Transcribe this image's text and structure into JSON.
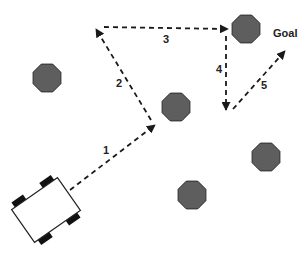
{
  "diagram": {
    "colors": {
      "obstacle_fill": "#5e5e5e",
      "obstacle_stroke": "#2e2e2e",
      "path": "#1a1a1a",
      "robot_body": "#ffffff",
      "robot_wheel": "#111111",
      "text": "#222222"
    },
    "goal_label": "Goal",
    "robot": {
      "cx": 46,
      "cy": 210,
      "width": 56,
      "height": 40,
      "angle": -35
    },
    "obstacles": [
      {
        "name": "obstacle-left",
        "cx": 47,
        "cy": 78,
        "r": 15
      },
      {
        "name": "obstacle-center",
        "cx": 176,
        "cy": 107,
        "r": 15
      },
      {
        "name": "obstacle-top-right",
        "cx": 246,
        "cy": 29,
        "r": 15
      },
      {
        "name": "obstacle-right",
        "cx": 266,
        "cy": 157,
        "r": 15
      },
      {
        "name": "obstacle-bottom",
        "cx": 192,
        "cy": 195,
        "r": 15
      }
    ],
    "path_segments": [
      {
        "label": "1",
        "x1": 70,
        "y1": 190,
        "x2": 155,
        "y2": 125,
        "label_x": 103,
        "label_y": 154
      },
      {
        "label": "2",
        "x1": 151,
        "y1": 120,
        "x2": 96,
        "y2": 29,
        "label_x": 116,
        "label_y": 87
      },
      {
        "label": "3",
        "x1": 104,
        "y1": 27,
        "x2": 228,
        "y2": 29,
        "label_x": 163,
        "label_y": 43
      },
      {
        "label": "4",
        "x1": 226,
        "y1": 36,
        "x2": 226,
        "y2": 110,
        "label_x": 216,
        "label_y": 73
      },
      {
        "label": "5",
        "x1": 233,
        "y1": 109,
        "x2": 285,
        "y2": 51,
        "label_x": 261,
        "label_y": 89
      }
    ]
  }
}
